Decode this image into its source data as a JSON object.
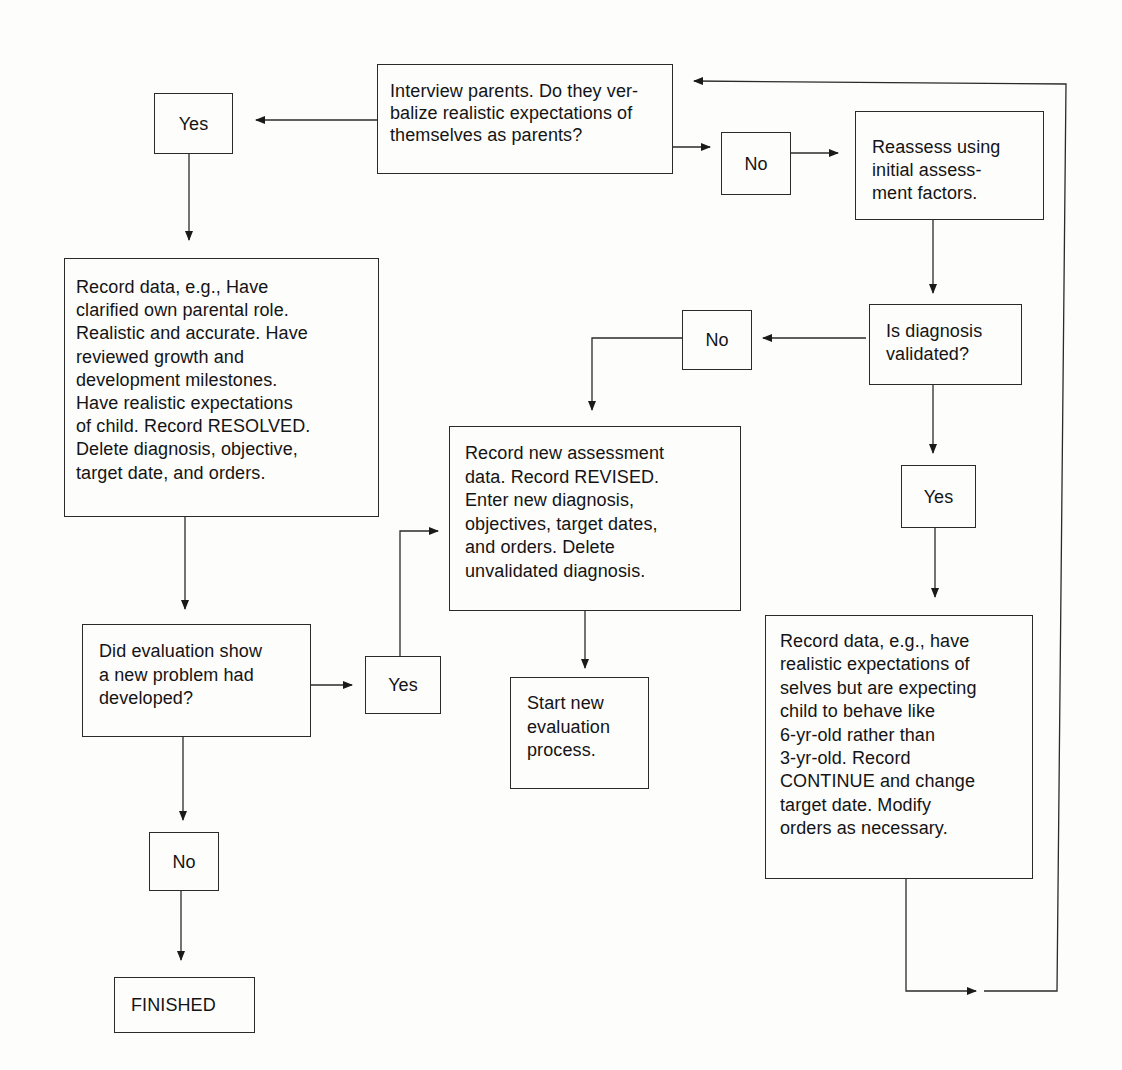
{
  "diagram": {
    "type": "flowchart",
    "nodes": {
      "interview": {
        "text": "Interview parents. Do they ver-\nbalize realistic expectations of\nthemselves as parents?"
      },
      "yes_top": {
        "text": "Yes"
      },
      "no_top": {
        "text": "No"
      },
      "reassess": {
        "text": "Reassess using\ninitial assess-\nment factors."
      },
      "record_resolved": {
        "text": "Record data, e.g., Have\nclarified own parental role.\nRealistic and accurate. Have\nreviewed growth and\ndevelopment milestones.\nHave realistic expectations\nof child. Record RESOLVED.\nDelete diagnosis, objective,\ntarget date, and orders."
      },
      "is_validated": {
        "text": "Is diagnosis\nvalidated?"
      },
      "no_validated": {
        "text": "No"
      },
      "record_revised": {
        "text": "Record new assessment\ndata. Record REVISED.\nEnter new diagnosis,\nobjectives, target dates,\nand orders. Delete\nunvalidated diagnosis."
      },
      "yes_validated": {
        "text": "Yes"
      },
      "did_eval": {
        "text": "Did evaluation show\na new problem had\ndeveloped?"
      },
      "yes_eval": {
        "text": "Yes"
      },
      "start_new": {
        "text": "Start new\nevaluation\nprocess."
      },
      "record_continue": {
        "text": "Record data, e.g., have\nrealistic expectations of\nselves but are expecting\nchild to behave like\n6-yr-old rather than\n3-yr-old. Record\nCONTINUE and change\ntarget date. Modify\norders as necessary."
      },
      "no_eval": {
        "text": "No"
      },
      "finished": {
        "text": "FINISHED"
      }
    },
    "edges": [
      {
        "from": "interview",
        "to": "yes_top"
      },
      {
        "from": "interview",
        "to": "no_top"
      },
      {
        "from": "no_top",
        "to": "reassess"
      },
      {
        "from": "yes_top",
        "to": "record_resolved"
      },
      {
        "from": "reassess",
        "to": "is_validated"
      },
      {
        "from": "is_validated",
        "to": "no_validated"
      },
      {
        "from": "no_validated",
        "to": "record_revised"
      },
      {
        "from": "is_validated",
        "to": "yes_validated"
      },
      {
        "from": "yes_validated",
        "to": "record_continue"
      },
      {
        "from": "record_resolved",
        "to": "did_eval"
      },
      {
        "from": "did_eval",
        "to": "yes_eval"
      },
      {
        "from": "yes_eval",
        "to": "record_revised"
      },
      {
        "from": "record_revised",
        "to": "start_new"
      },
      {
        "from": "did_eval",
        "to": "no_eval"
      },
      {
        "from": "no_eval",
        "to": "finished"
      },
      {
        "from": "record_continue",
        "to": "interview"
      }
    ]
  }
}
